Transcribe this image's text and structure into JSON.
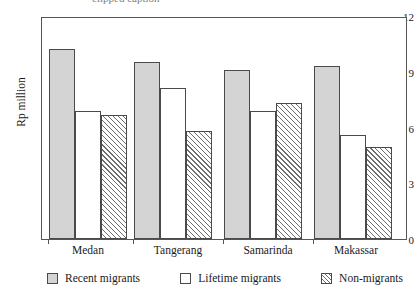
{
  "chart_data": {
    "type": "bar",
    "title": "",
    "xlabel": "",
    "ylabel": "Rp million",
    "ylim": [
      0,
      12
    ],
    "yticks": [
      "0",
      "3",
      "6",
      "9",
      "12"
    ],
    "grid": false,
    "legend_position": "bottom",
    "categories": [
      "Medan",
      "Tangerang",
      "Samarinda",
      "Makassar"
    ],
    "series": [
      {
        "name": "Recent migrants",
        "style": "solid-gray",
        "values": [
          10.2,
          9.5,
          9.1,
          9.3
        ]
      },
      {
        "name": "Lifetime migrants",
        "style": "white",
        "values": [
          6.9,
          8.1,
          6.9,
          5.6
        ]
      },
      {
        "name": "Non-migrants",
        "style": "hatched",
        "values": [
          6.7,
          5.8,
          7.3,
          4.95
        ]
      }
    ]
  },
  "axis": {
    "y_title": "Rp million",
    "y_ticks": [
      {
        "label": "12",
        "value": 12
      },
      {
        "label": "9",
        "value": 9
      },
      {
        "label": "6",
        "value": 6
      },
      {
        "label": "3",
        "value": 3
      },
      {
        "label": "0",
        "value": 0
      }
    ],
    "x_categories": [
      "Medan",
      "Tangerang",
      "Samarinda",
      "Makassar"
    ]
  },
  "legend": {
    "items": [
      {
        "label": "Recent migrants",
        "swatch": "solid-gray-swatch-icon"
      },
      {
        "label": "Lifetime migrants",
        "swatch": "white-swatch-icon"
      },
      {
        "label": "Non-migrants",
        "swatch": "hatched-swatch-icon"
      }
    ]
  },
  "top_caption": "clipped caption"
}
